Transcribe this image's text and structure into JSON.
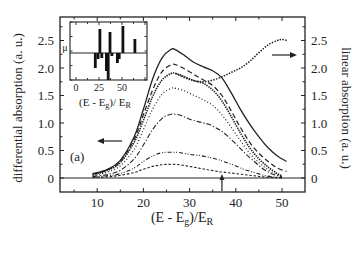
{
  "chart_data": {
    "type": "line",
    "panel_label": "(a)",
    "xlabel": "(E - E_g)/E_R",
    "xlabel_parts": {
      "main": "(E - E",
      "sub1": "g",
      "mid": ")/E",
      "sub2": "R"
    },
    "ylabel_left": "differential absorption (a. u.)",
    "ylabel_right": "linear absorption (a. u.)",
    "xlim": [
      0,
      55
    ],
    "ylim": [
      -0.25,
      2.8
    ],
    "xticks": [
      10,
      20,
      30,
      40,
      50
    ],
    "yticks_left": [
      "0",
      "0.5",
      "1.0",
      "1.5",
      "2.0",
      "2.5"
    ],
    "yticks_right": [
      "0",
      "0.5",
      "1.0",
      "1.5",
      "2.0",
      "2.5"
    ],
    "marker_arrow_x": 37,
    "series": [
      {
        "name": "differential 1 (solid)",
        "axis": "left",
        "style": "solid",
        "x": [
          9,
          12,
          15,
          18,
          20,
          22,
          24,
          26,
          27,
          29,
          31,
          33,
          35,
          37,
          39,
          41,
          43,
          45,
          47,
          49,
          51
        ],
        "y": [
          0.08,
          0.15,
          0.32,
          0.75,
          1.25,
          1.8,
          2.18,
          2.34,
          2.33,
          2.22,
          2.1,
          2.02,
          1.95,
          1.82,
          1.55,
          1.25,
          0.98,
          0.75,
          0.55,
          0.4,
          0.3
        ]
      },
      {
        "name": "differential 2 (dashed)",
        "axis": "left",
        "style": "dashed",
        "x": [
          9,
          12,
          15,
          18,
          20,
          22,
          24,
          26,
          27,
          29,
          31,
          33,
          35,
          37,
          39,
          41,
          43,
          45,
          47,
          49,
          51
        ],
        "y": [
          0.07,
          0.14,
          0.3,
          0.7,
          1.15,
          1.6,
          1.93,
          2.06,
          2.06,
          1.98,
          1.88,
          1.78,
          1.68,
          1.5,
          1.22,
          0.92,
          0.65,
          0.45,
          0.3,
          0.18,
          0.12
        ]
      },
      {
        "name": "differential 3 (dense dotted)",
        "axis": "left",
        "style": "dense-dot",
        "x": [
          9,
          12,
          15,
          18,
          20,
          22,
          24,
          26,
          27,
          29,
          31,
          33,
          35,
          37,
          39,
          41,
          43,
          45,
          47,
          49,
          50
        ],
        "y": [
          0.06,
          0.13,
          0.28,
          0.65,
          1.05,
          1.48,
          1.78,
          1.9,
          1.9,
          1.84,
          1.77,
          1.72,
          1.6,
          1.4,
          1.12,
          0.82,
          0.55,
          0.35,
          0.2,
          0.08,
          0.04
        ]
      },
      {
        "name": "differential 4 (dotted)",
        "axis": "left",
        "style": "dotted",
        "x": [
          9,
          12,
          15,
          18,
          20,
          22,
          24,
          26,
          27,
          29,
          31,
          33,
          35,
          37,
          39,
          41,
          43,
          45,
          47,
          49,
          50
        ],
        "y": [
          0.05,
          0.1,
          0.22,
          0.52,
          0.88,
          1.25,
          1.52,
          1.63,
          1.63,
          1.58,
          1.5,
          1.42,
          1.32,
          1.15,
          0.92,
          0.68,
          0.45,
          0.28,
          0.15,
          0.06,
          0.03
        ]
      },
      {
        "name": "differential 5 (dash-dot)",
        "axis": "left",
        "style": "dash-dot",
        "x": [
          9,
          12,
          15,
          18,
          20,
          22,
          24,
          26,
          28,
          30,
          32,
          34,
          36,
          38,
          40,
          42,
          44,
          46,
          48,
          50
        ],
        "y": [
          0.03,
          0.06,
          0.14,
          0.35,
          0.6,
          0.88,
          1.08,
          1.16,
          1.14,
          1.07,
          1.02,
          0.98,
          0.9,
          0.78,
          0.62,
          0.45,
          0.3,
          0.16,
          0.07,
          0.02
        ]
      },
      {
        "name": "differential 6 (dash-dot-dot)",
        "axis": "left",
        "style": "dash-dot-dot",
        "x": [
          9,
          12,
          15,
          18,
          20,
          22,
          24,
          26,
          28,
          30,
          32,
          34,
          36,
          38,
          40,
          42,
          44,
          46,
          48,
          50
        ],
        "y": [
          0.02,
          0.04,
          0.08,
          0.18,
          0.3,
          0.4,
          0.46,
          0.47,
          0.46,
          0.43,
          0.41,
          0.38,
          0.34,
          0.28,
          0.22,
          0.15,
          0.1,
          0.05,
          0.02,
          0.01
        ]
      },
      {
        "name": "differential 7 (short dash)",
        "axis": "left",
        "style": "short-dash",
        "x": [
          9,
          12,
          15,
          18,
          20,
          22,
          24,
          26,
          28,
          30,
          32,
          34,
          36,
          38,
          40,
          42,
          44,
          46,
          48,
          50
        ],
        "y": [
          0.01,
          0.02,
          0.05,
          0.1,
          0.16,
          0.21,
          0.24,
          0.25,
          0.24,
          0.21,
          0.18,
          0.15,
          0.12,
          0.1,
          0.08,
          0.06,
          0.04,
          0.02,
          0.01,
          0.0
        ]
      },
      {
        "name": "linear absorption (dotted)",
        "axis": "right",
        "style": "linear-dot",
        "x": [
          27,
          29,
          31,
          33,
          35,
          37,
          39,
          41,
          43,
          45,
          47,
          49,
          50,
          51
        ],
        "y": [
          1.9,
          1.82,
          1.77,
          1.75,
          1.78,
          1.84,
          1.92,
          2.0,
          2.12,
          2.28,
          2.42,
          2.5,
          2.52,
          2.5
        ]
      }
    ],
    "inset": {
      "type": "bar",
      "xlabel": "(E - E_g)/ E_R",
      "xlabel_parts": {
        "main": "(E - E",
        "sub1": "g",
        "mid": ")/ E",
        "sub2": "R"
      },
      "ylabel": "μ",
      "xticks": [
        "0",
        "25",
        "50"
      ],
      "xlim": [
        -7,
        77
      ],
      "bars": [
        {
          "x": 21,
          "h": -15
        },
        {
          "x": 24,
          "h": -6
        },
        {
          "x": 26,
          "h": 24
        },
        {
          "x": 28,
          "h": -5
        },
        {
          "x": 33,
          "h": -18
        },
        {
          "x": 35,
          "h": -27
        },
        {
          "x": 37,
          "h": 21
        },
        {
          "x": 39,
          "h": -3
        },
        {
          "x": 45,
          "h": -10
        },
        {
          "x": 47,
          "h": -6
        },
        {
          "x": 51,
          "h": 27
        },
        {
          "x": 64,
          "h": 14
        }
      ]
    },
    "legend": "none",
    "grid": false
  }
}
